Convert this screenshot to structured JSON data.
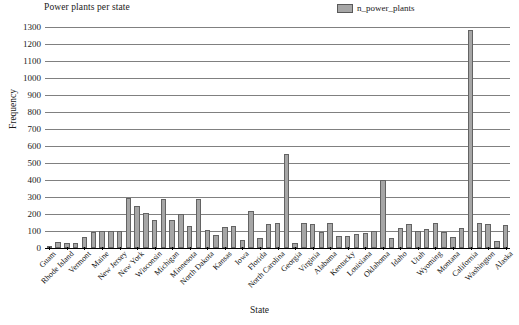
{
  "chart": {
    "title": "Power plants per state",
    "xlabel": "State",
    "ylabel": "Frequency",
    "legend_label": "n_power_plants",
    "bar_color": "#a6a6a6",
    "bar_edge_color": "#636363",
    "grid_color": "#808080"
  },
  "chart_data": {
    "type": "bar",
    "title": "Power plants per state",
    "xlabel": "State",
    "ylabel": "Frequency",
    "legend": [
      "n_power_plants"
    ],
    "legend_position": "top-right",
    "grid": true,
    "ylim": [
      0,
      1300
    ],
    "yticks": [
      0,
      100,
      200,
      300,
      400,
      500,
      600,
      700,
      800,
      900,
      1000,
      1100,
      1200,
      1300
    ],
    "categories": [
      "Guam",
      "District of Columbia",
      "Rhode Island",
      "Delaware",
      "Vermont",
      "New Hampshire",
      "Maine",
      "Connecticut",
      "New Jersey",
      "Massachusetts",
      "New York",
      "Pennsylvania",
      "Wisconsin",
      "Ohio",
      "Michigan",
      "Indiana",
      "Minnesota",
      "Illinois",
      "North Dakota",
      "South Dakota",
      "Kansas",
      "Nebraska",
      "Iowa",
      "Missouri",
      "Florida",
      "South Carolina",
      "North Carolina",
      "Tennessee",
      "Georgia",
      "West Virginia",
      "Virginia",
      "Maryland",
      "Alabama",
      "Mississippi",
      "Kentucky",
      "Arkansas",
      "Louisiana",
      "Texas",
      "Oklahoma",
      "New Mexico",
      "Idaho",
      "Nevada",
      "Utah",
      "Colorado",
      "Wyoming",
      "Arizona",
      "Montana",
      "Oregon",
      "California",
      "Hawaii",
      "Washington",
      "Puerto Rico",
      "Alaska"
    ],
    "tick_labels": [
      "Guam",
      "Rhode Island",
      "Vermont",
      "Maine",
      "New Jersey",
      "New York",
      "Wisconsin",
      "Michigan",
      "Minnesota",
      "North Dakota",
      "Kansas",
      "Iowa",
      "Florida",
      "North Carolina",
      "Georgia",
      "Virginia",
      "Alabama",
      "Kentucky",
      "Louisiana",
      "Oklahoma",
      "Idaho",
      "Utah",
      "Wyoming",
      "Montana",
      "California",
      "Washington",
      "Alaska"
    ],
    "values": [
      10,
      35,
      30,
      30,
      65,
      95,
      98,
      98,
      98,
      295,
      250,
      205,
      165,
      290,
      165,
      200,
      130,
      290,
      105,
      75,
      125,
      130,
      50,
      215,
      60,
      140,
      150,
      555,
      30,
      150,
      140,
      95,
      150,
      70,
      70,
      80,
      90,
      100,
      400,
      60,
      115,
      140,
      100,
      110,
      150,
      95,
      65,
      120,
      1280,
      150,
      140,
      40,
      135
    ],
    "series": [
      {
        "name": "n_power_plants",
        "values": [
          10,
          35,
          30,
          30,
          65,
          95,
          98,
          98,
          98,
          295,
          250,
          205,
          165,
          290,
          165,
          200,
          130,
          290,
          105,
          75,
          125,
          130,
          50,
          215,
          60,
          140,
          150,
          555,
          30,
          150,
          140,
          95,
          150,
          70,
          70,
          80,
          90,
          100,
          400,
          60,
          115,
          140,
          100,
          110,
          150,
          95,
          65,
          120,
          1280,
          150,
          140,
          40,
          135
        ]
      }
    ]
  }
}
